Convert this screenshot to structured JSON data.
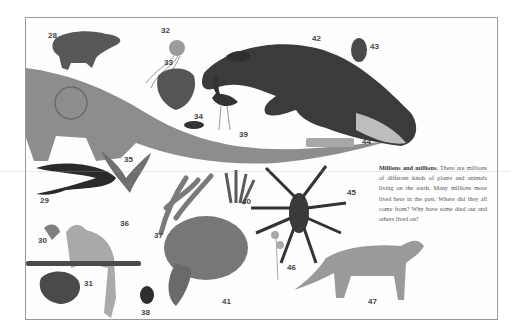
{
  "page": {
    "heading": "Millions and millions.",
    "body": "There are millions of different kinds of plants and animals living on the earth. Many millions more lived here in the past. Where did they all come from? Why have some died out and others lived on?"
  },
  "labels": [
    {
      "id": "28",
      "subject": "capybara"
    },
    {
      "id": "29",
      "subject": "eel"
    },
    {
      "id": "30",
      "subject": "plant-sprout"
    },
    {
      "id": "31",
      "subject": "sponge"
    },
    {
      "id": "32",
      "subject": "jellyfish"
    },
    {
      "id": "33",
      "subject": "strawberry"
    },
    {
      "id": "34",
      "subject": "ant"
    },
    {
      "id": "35",
      "subject": "whale-tail-bird"
    },
    {
      "id": "36",
      "subject": "monkey"
    },
    {
      "id": "37",
      "subject": "seaweed"
    },
    {
      "id": "38",
      "subject": "beetle"
    },
    {
      "id": "39",
      "subject": "ostrich"
    },
    {
      "id": "40",
      "subject": "sea-plant"
    },
    {
      "id": "41",
      "subject": "sea-turtle"
    },
    {
      "id": "42",
      "subject": "whale"
    },
    {
      "id": "43",
      "subject": "seed-pod"
    },
    {
      "id": "44",
      "subject": "diatom"
    },
    {
      "id": "45",
      "subject": "tarantula"
    },
    {
      "id": "46",
      "subject": "fungus"
    },
    {
      "id": "47",
      "subject": "thylacine"
    }
  ],
  "colors": {
    "border": "#9a9a9a",
    "label": "#444444",
    "text": "#555555",
    "dino": "#8a8a8a",
    "whale": "#3a3a3a"
  }
}
